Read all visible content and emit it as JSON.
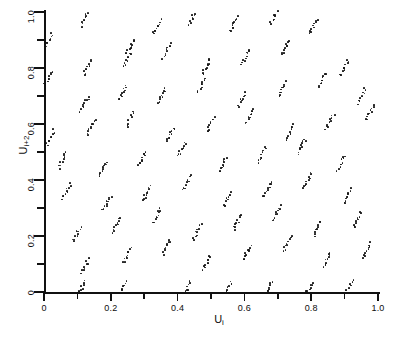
{
  "figure": {
    "background": "#ffffff",
    "ink_color": "#171717"
  },
  "axes": {
    "x": {
      "label": "U",
      "label_sub": "i",
      "range": [
        0,
        1.0
      ],
      "tick_values": [
        0,
        0.1,
        0.2,
        0.3,
        0.4,
        0.5,
        0.6,
        0.7,
        0.8,
        0.9,
        1.0
      ],
      "tick_labels": [
        "0",
        "",
        "0.2",
        "",
        "0.4",
        "",
        "0.6",
        "",
        "0.8",
        "",
        "1.0"
      ],
      "pixel_origin": 44,
      "pixel_span": 334
    },
    "y": {
      "label": "U",
      "label_sub": "i+2",
      "range": [
        0,
        1.0
      ],
      "tick_values": [
        0,
        0.1,
        0.2,
        0.3,
        0.4,
        0.5,
        0.6,
        0.7,
        0.8,
        0.9,
        1.0
      ],
      "tick_labels": [
        "0",
        "",
        "0.2",
        "",
        "0.4",
        "",
        "0.6",
        "",
        "0.8",
        "",
        "1.0"
      ],
      "pixel_origin": 292,
      "pixel_span": 280
    },
    "grid": false,
    "frame": "left-bottom-only"
  },
  "chart_data": {
    "type": "scatter",
    "title": "",
    "xlabel": "U_i",
    "ylabel": "U_{i+2}",
    "xlim": [
      0,
      1.0
    ],
    "ylim": [
      0,
      1.0
    ],
    "grid": false,
    "legend": "none",
    "marker": "dot",
    "marker_size_px": 1.7,
    "cluster_geometry": {
      "points_per_cluster": 10,
      "streak_dx": 0.022,
      "streak_dy": 0.052,
      "jitter": 0.004
    },
    "clusters": [
      {
        "x": 0.013,
        "y": 0.895
      },
      {
        "x": 0.122,
        "y": 0.975
      },
      {
        "x": 0.338,
        "y": 0.945
      },
      {
        "x": 0.445,
        "y": 0.982
      },
      {
        "x": 0.568,
        "y": 0.955
      },
      {
        "x": 0.69,
        "y": 0.985
      },
      {
        "x": 0.806,
        "y": 0.948
      },
      {
        "x": 0.258,
        "y": 0.875
      },
      {
        "x": 0.012,
        "y": 0.76
      },
      {
        "x": 0.13,
        "y": 0.8
      },
      {
        "x": 0.248,
        "y": 0.828
      },
      {
        "x": 0.368,
        "y": 0.862
      },
      {
        "x": 0.487,
        "y": 0.805
      },
      {
        "x": 0.604,
        "y": 0.84
      },
      {
        "x": 0.722,
        "y": 0.872
      },
      {
        "x": 0.9,
        "y": 0.8
      },
      {
        "x": 0.122,
        "y": 0.672
      },
      {
        "x": 0.236,
        "y": 0.712
      },
      {
        "x": 0.352,
        "y": 0.7
      },
      {
        "x": 0.47,
        "y": 0.735
      },
      {
        "x": 0.592,
        "y": 0.69
      },
      {
        "x": 0.712,
        "y": 0.725
      },
      {
        "x": 0.832,
        "y": 0.755
      },
      {
        "x": 0.952,
        "y": 0.7
      },
      {
        "x": 0.02,
        "y": 0.552
      },
      {
        "x": 0.14,
        "y": 0.588
      },
      {
        "x": 0.258,
        "y": 0.618
      },
      {
        "x": 0.378,
        "y": 0.562
      },
      {
        "x": 0.498,
        "y": 0.598
      },
      {
        "x": 0.618,
        "y": 0.63
      },
      {
        "x": 0.738,
        "y": 0.572
      },
      {
        "x": 0.856,
        "y": 0.608
      },
      {
        "x": 0.976,
        "y": 0.64
      },
      {
        "x": 0.055,
        "y": 0.47
      },
      {
        "x": 0.175,
        "y": 0.44
      },
      {
        "x": 0.295,
        "y": 0.478
      },
      {
        "x": 0.412,
        "y": 0.51
      },
      {
        "x": 0.535,
        "y": 0.452
      },
      {
        "x": 0.652,
        "y": 0.488
      },
      {
        "x": 0.772,
        "y": 0.52
      },
      {
        "x": 0.89,
        "y": 0.462
      },
      {
        "x": 0.068,
        "y": 0.36
      },
      {
        "x": 0.188,
        "y": 0.318
      },
      {
        "x": 0.308,
        "y": 0.352
      },
      {
        "x": 0.428,
        "y": 0.388
      },
      {
        "x": 0.548,
        "y": 0.33
      },
      {
        "x": 0.668,
        "y": 0.368
      },
      {
        "x": 0.788,
        "y": 0.398
      },
      {
        "x": 0.908,
        "y": 0.342
      },
      {
        "x": 0.098,
        "y": 0.205
      },
      {
        "x": 0.218,
        "y": 0.24
      },
      {
        "x": 0.338,
        "y": 0.272
      },
      {
        "x": 0.458,
        "y": 0.215
      },
      {
        "x": 0.578,
        "y": 0.25
      },
      {
        "x": 0.698,
        "y": 0.282
      },
      {
        "x": 0.818,
        "y": 0.225
      },
      {
        "x": 0.938,
        "y": 0.258
      },
      {
        "x": 0.125,
        "y": 0.095
      },
      {
        "x": 0.248,
        "y": 0.13
      },
      {
        "x": 0.368,
        "y": 0.162
      },
      {
        "x": 0.488,
        "y": 0.105
      },
      {
        "x": 0.608,
        "y": 0.14
      },
      {
        "x": 0.728,
        "y": 0.172
      },
      {
        "x": 0.848,
        "y": 0.115
      },
      {
        "x": 0.968,
        "y": 0.148
      },
      {
        "x": 0.112,
        "y": 0.012
      },
      {
        "x": 0.232,
        "y": 0.01
      },
      {
        "x": 0.428,
        "y": 0.008
      },
      {
        "x": 0.552,
        "y": 0.012
      },
      {
        "x": 0.672,
        "y": 0.01
      },
      {
        "x": 0.792,
        "y": 0.008
      },
      {
        "x": 0.912,
        "y": 0.012
      }
    ]
  }
}
